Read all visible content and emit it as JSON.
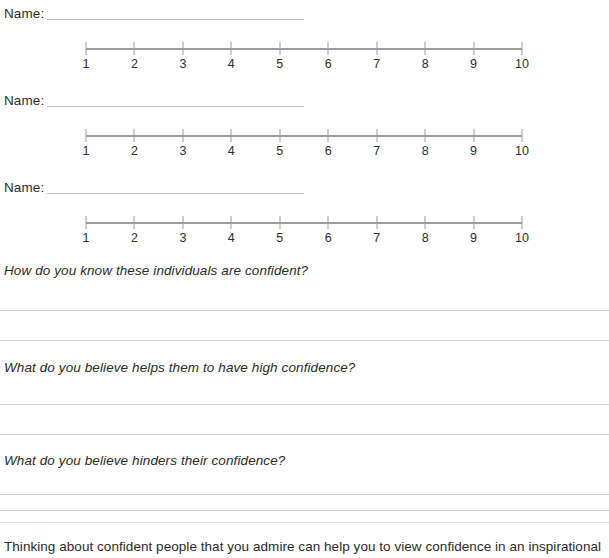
{
  "worksheet": {
    "name_label": "Name:",
    "scale": {
      "ticks": [
        "1",
        "2",
        "3",
        "4",
        "5",
        "6",
        "7",
        "8",
        "9",
        "10"
      ],
      "min": 1,
      "max": 10
    },
    "rows": [
      {
        "name_label": "Name:",
        "name_value": ""
      },
      {
        "name_label": "Name:",
        "name_value": ""
      },
      {
        "name_label": "Name:",
        "name_value": ""
      }
    ],
    "questions": [
      {
        "prompt": "How do you know these individuals are confident?",
        "answer_lines": [
          "",
          ""
        ]
      },
      {
        "prompt": "What do you believe helps them to have high confidence?",
        "answer_lines": [
          "",
          ""
        ]
      },
      {
        "prompt": "What do you believe hinders their confidence?",
        "answer_lines": [
          "",
          ""
        ]
      }
    ],
    "footer_text": "Thinking about confident people that you admire can help you to view confidence in an inspirational",
    "colors": {
      "axis": "#9a9da1",
      "rule": "#cfd2d6",
      "name_rule": "#b9bcc0",
      "divider": "#dfe1e4",
      "text": "#2b2b2b"
    }
  }
}
